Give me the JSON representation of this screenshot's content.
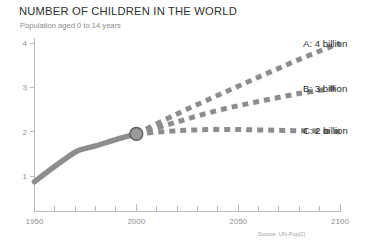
{
  "header": {
    "title": "NUMBER OF CHILDREN IN THE WORLD",
    "subtitle": "Population aged 0 to 14 years",
    "source": "Source: UN-Pop[2]"
  },
  "labels": {
    "a": "A: 4 billion",
    "b": "B: 3 billion",
    "c": "C: 2 billion"
  },
  "colors": {
    "line": "#8d8d8d",
    "marker_fill": "#9a9a9a",
    "marker_stroke": "#5e5e5e",
    "axis": "#b9b9b9",
    "title": "#2f2f2f",
    "subtitle": "#8a8a8a",
    "source": "#a0a0a0"
  },
  "chart_data": {
    "type": "line",
    "title": "NUMBER OF CHILDREN IN THE WORLD",
    "subtitle": "Population aged 0 to 14 years",
    "xlabel": "",
    "ylabel": "",
    "yunit": "billion",
    "xlim": [
      1950,
      2100
    ],
    "ylim": [
      0,
      4.3
    ],
    "grid": false,
    "legend": "right-of-line-ends",
    "xticks": [
      1950,
      2000,
      2050,
      2100
    ],
    "xticklabels": [
      "1950",
      "2000",
      "2050",
      "2100"
    ],
    "xminorticks": [
      1960,
      1970,
      1980,
      1990,
      2010,
      2020,
      2030,
      2040,
      2060,
      2070,
      2080,
      2090
    ],
    "yticks": [
      1,
      2,
      3,
      4
    ],
    "yticklabels": [
      "1",
      "2",
      "3",
      "4"
    ],
    "annotations": [
      {
        "type": "marker",
        "shape": "circle",
        "x": 2000,
        "y": 1.95,
        "note": "branch point between history and projections"
      }
    ],
    "series": [
      {
        "name": "Historical",
        "style": "solid",
        "x": [
          1950,
          1960,
          1970,
          1975,
          1980,
          1990,
          2000
        ],
        "values": [
          0.87,
          1.22,
          1.54,
          1.62,
          1.68,
          1.82,
          1.95
        ]
      },
      {
        "name": "A: 4 billion",
        "label": "A: 4 billion",
        "style": "dashed",
        "x": [
          2000,
          2020,
          2040,
          2060,
          2080,
          2100
        ],
        "values": [
          1.95,
          2.4,
          2.82,
          3.23,
          3.63,
          4.0
        ]
      },
      {
        "name": "B: 3 billion",
        "label": "B: 3 billion",
        "style": "dashed",
        "x": [
          2000,
          2020,
          2040,
          2060,
          2080,
          2100
        ],
        "values": [
          1.95,
          2.22,
          2.48,
          2.68,
          2.86,
          3.0
        ]
      },
      {
        "name": "C: 2 billion",
        "label": "C: 2 billion",
        "style": "dashed",
        "x": [
          2000,
          2020,
          2040,
          2060,
          2080,
          2100
        ],
        "values": [
          1.95,
          2.02,
          2.05,
          2.04,
          2.02,
          2.0
        ]
      }
    ]
  }
}
